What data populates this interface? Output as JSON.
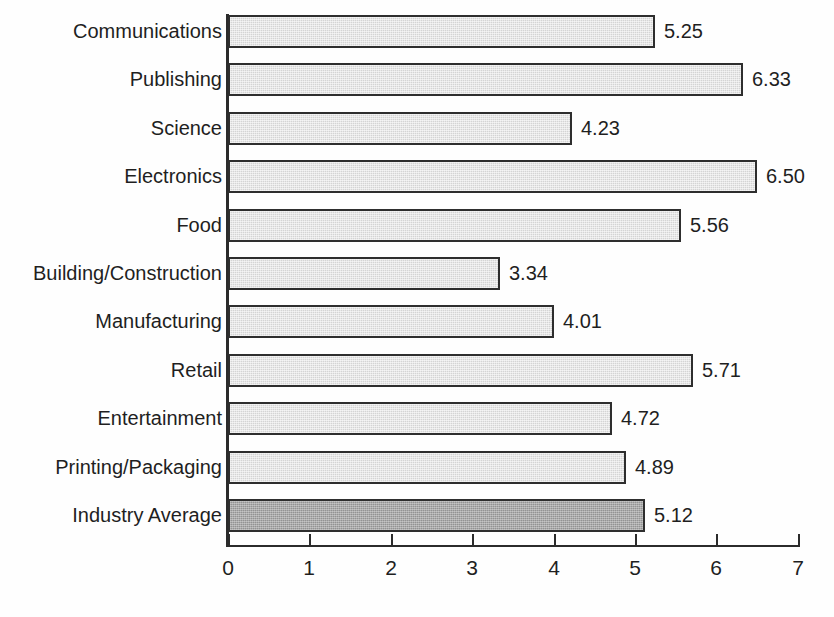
{
  "chart_data": {
    "type": "bar",
    "orientation": "horizontal",
    "title": "",
    "subtitle": "",
    "xlabel": "",
    "ylabel": "",
    "xlim": [
      0,
      7
    ],
    "xticks": [
      "0",
      "1",
      "2",
      "3",
      "4",
      "5",
      "6",
      "7"
    ],
    "grid": false,
    "legend": "none",
    "value_label_format": "two-decimal",
    "categories": [
      "Communications",
      "Publishing",
      "Science",
      "Electronics",
      "Food",
      "Building/Construction",
      "Manufacturing",
      "Retail",
      "Entertainment",
      "Printing/Packaging",
      "Industry Average"
    ],
    "values": [
      5.25,
      6.33,
      4.23,
      6.5,
      5.56,
      3.34,
      4.01,
      5.71,
      4.72,
      4.89,
      5.12
    ],
    "value_labels": [
      "5.25",
      "6.33",
      "4.23",
      "6.50",
      "5.56",
      "3.34",
      "4.01",
      "5.71",
      "4.72",
      "4.89",
      "5.12"
    ],
    "highlight_index": 10,
    "colors": {
      "bar_fill": "#d4d4d4",
      "bar_highlight_fill": "#939393",
      "bar_border": "#2e2e2e",
      "axis": "#2b2b2b",
      "text": "#1f1f1f",
      "background": "#fefefe"
    }
  }
}
